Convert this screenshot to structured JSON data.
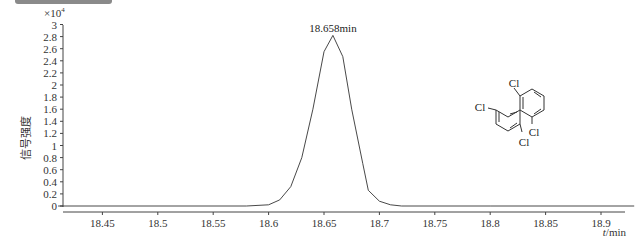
{
  "header_bar": {
    "color": "#8a8a8a"
  },
  "chart_data": {
    "type": "line",
    "title": "",
    "xlabel": "t/min",
    "ylabel": "信号强度",
    "y_multiplier": "×10⁴",
    "xlim": [
      18.41,
      18.93
    ],
    "ylim": [
      0,
      3
    ],
    "x_ticks": [
      "18.45",
      "18.5",
      "18.55",
      "18.6",
      "18.65",
      "18.7",
      "18.75",
      "18.8",
      "18.85",
      "18.9"
    ],
    "y_ticks": [
      "0",
      "0.2",
      "0.4",
      "0.6",
      "0.8",
      "1",
      "1.2",
      "1.4",
      "1.6",
      "1.8",
      "2",
      "2.2",
      "2.4",
      "2.6",
      "2.8",
      "3"
    ],
    "grid": false,
    "series": [
      {
        "name": "chromatogram",
        "x": [
          18.41,
          18.58,
          18.6,
          18.61,
          18.62,
          18.63,
          18.64,
          18.65,
          18.658,
          18.667,
          18.675,
          18.685,
          18.69,
          18.7,
          18.71,
          18.72,
          18.8,
          18.93
        ],
        "y": [
          0,
          0,
          200,
          1000,
          3200,
          8000,
          16000,
          25500,
          28200,
          24700,
          16000,
          7000,
          2600,
          800,
          200,
          0,
          0,
          0
        ]
      }
    ],
    "annotations": [
      {
        "text": "18.658min",
        "x": 18.658,
        "y": 28200
      }
    ],
    "inset": {
      "type": "chemical-structure",
      "labels": [
        "Cl",
        "Cl",
        "Cl",
        "Cl"
      ],
      "description": "2,2',5,6'-tetrachlorobiphenyl"
    }
  },
  "labels": {
    "multiplier": "×10",
    "exponent": "4",
    "peak": "18.658min",
    "xaxis_italic": "t",
    "xaxis_unit": "/min",
    "yaxis": "信号强度",
    "cl1": "Cl",
    "cl2": "Cl",
    "cl3": "Cl",
    "cl4": "Cl"
  }
}
